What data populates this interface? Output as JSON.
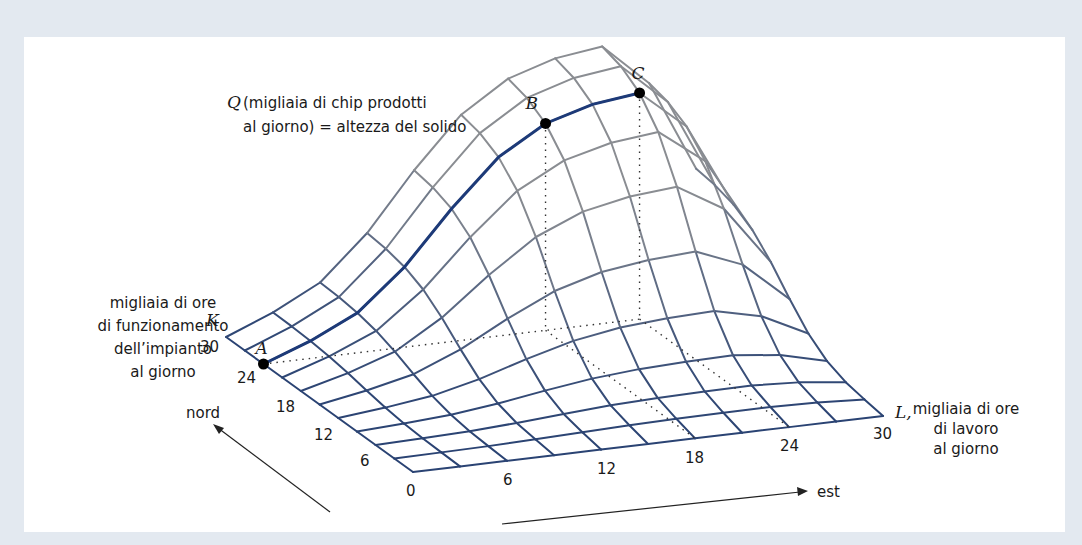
{
  "figure": {
    "title_q": "Q",
    "q_label_line1": "(migliaia di chip prodotti",
    "q_label_line2": "al giorno) = altezza del solido",
    "k_axis": {
      "symbol": "K",
      "label_lines": [
        "migliaia di ore",
        "di funzionamento",
        "dell’impianto",
        "al giorno"
      ],
      "ticks": [
        "0",
        "6",
        "12",
        "18",
        "24",
        "30"
      ]
    },
    "l_axis": {
      "symbol": "L,",
      "label_lines": [
        "migliaia di ore",
        "di lavoro",
        "al giorno"
      ],
      "ticks": [
        "0",
        "6",
        "12",
        "18",
        "24",
        "30"
      ]
    },
    "direction_north": "nord",
    "direction_east": "est",
    "points": [
      {
        "name": "A",
        "L": 0,
        "K": 24
      },
      {
        "name": "B",
        "L": 18,
        "K": 24
      },
      {
        "name": "C",
        "L": 24,
        "K": 24
      }
    ],
    "colors": {
      "frame": "#e3e9f0",
      "mesh_low": "#2a4373",
      "mesh_high": "#8a8d92",
      "path": "#1d3a78",
      "point": "#000000"
    },
    "grid": {
      "divisions": 10,
      "max": 30
    }
  }
}
